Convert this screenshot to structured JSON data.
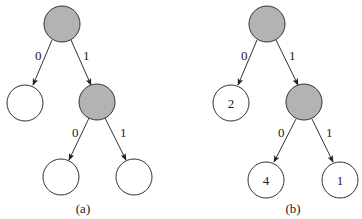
{
  "colors": {
    "internal_fill": "#b3b3b3",
    "leaf_fill": "#ffffff",
    "stroke": "#333333"
  },
  "trees": [
    {
      "caption": "(a)",
      "nodes": [
        {
          "id": "root",
          "type": "internal",
          "label": ""
        },
        {
          "id": "left",
          "type": "leaf",
          "label": ""
        },
        {
          "id": "right",
          "type": "internal",
          "label": ""
        },
        {
          "id": "right-left",
          "type": "leaf",
          "label": ""
        },
        {
          "id": "right-right",
          "type": "leaf",
          "label": ""
        }
      ],
      "edges": [
        {
          "from": "root",
          "to": "left",
          "label": "0"
        },
        {
          "from": "root",
          "to": "right",
          "label": "1"
        },
        {
          "from": "right",
          "to": "right-left",
          "label": "0"
        },
        {
          "from": "right",
          "to": "right-right",
          "label": "1"
        }
      ]
    },
    {
      "caption": "(b)",
      "nodes": [
        {
          "id": "root",
          "type": "internal",
          "label": ""
        },
        {
          "id": "left",
          "type": "leaf",
          "label": "2"
        },
        {
          "id": "right",
          "type": "internal",
          "label": ""
        },
        {
          "id": "right-left",
          "type": "leaf",
          "label": "4"
        },
        {
          "id": "right-right",
          "type": "leaf",
          "label": "1"
        }
      ],
      "edges": [
        {
          "from": "root",
          "to": "left",
          "label": "0"
        },
        {
          "from": "root",
          "to": "right",
          "label": "1"
        },
        {
          "from": "right",
          "to": "right-left",
          "label": "0"
        },
        {
          "from": "right",
          "to": "right-right",
          "label": "1"
        }
      ]
    }
  ]
}
